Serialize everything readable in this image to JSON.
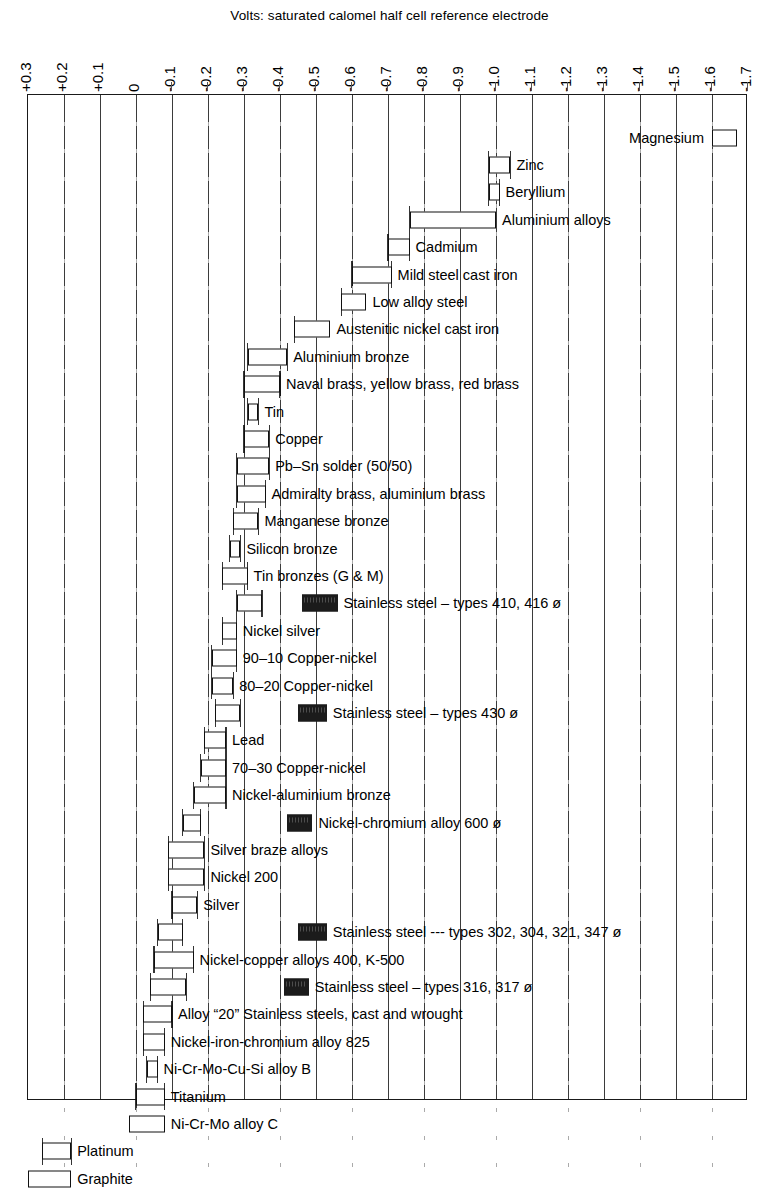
{
  "caption": "Volts: saturated calomel half cell reference electrode",
  "axis": {
    "tick_labels": [
      "+0.3",
      "+0.2",
      "+0.1",
      "0",
      "-0.1",
      "-0.2",
      "-0.3",
      "-0.4",
      "-0.5",
      "-0.6",
      "-0.7",
      "-0.8",
      "-0.9",
      "-1.0",
      "-1.1",
      "-1.2",
      "-1.3",
      "-1.4",
      "-1.5",
      "-1.6",
      "-1.7"
    ],
    "min": 0.3,
    "max": -1.7,
    "step": -0.1,
    "grid": true
  },
  "colors": {
    "active_bar_fill": "#ffffff",
    "passive_bar_fill": "#1b1b1b",
    "line": "#111111",
    "grid": "#3b3b3b"
  },
  "legend_note": "ø = passive (black bar) behaviour for stainless steels and nickel–chromium alloy",
  "chart_data": {
    "type": "bar",
    "orientation": "horizontal",
    "title": "Volts: saturated calomel half cell reference electrode",
    "xlabel": "Volts: saturated calomel half cell reference electrode",
    "ylabel": "",
    "xlim": [
      0.3,
      -1.7
    ],
    "xticks": [
      0.3,
      0.2,
      0.1,
      0,
      -0.1,
      -0.2,
      -0.3,
      -0.4,
      -0.5,
      -0.6,
      -0.7,
      -0.8,
      -0.9,
      -1.0,
      -1.1,
      -1.2,
      -1.3,
      -1.4,
      -1.5,
      -1.6,
      -1.7
    ],
    "grid": true,
    "legend": [
      "Active range (hollow bar)",
      "Passive range (solid bar)"
    ],
    "legend_position": "none",
    "rows": [
      {
        "label": "Magnesium",
        "label_side": "left",
        "bars": [
          {
            "start": -1.6,
            "end": -1.67,
            "state": "active"
          }
        ]
      },
      {
        "label": "Zinc",
        "label_side": "right",
        "bars": [
          {
            "start": -0.98,
            "end": -1.04,
            "state": "active"
          }
        ]
      },
      {
        "label": "Beryllium",
        "label_side": "right",
        "bars": [
          {
            "start": -0.98,
            "end": -1.01,
            "state": "active"
          }
        ]
      },
      {
        "label": "Aluminium alloys",
        "label_side": "right",
        "bars": [
          {
            "start": -0.76,
            "end": -1.0,
            "state": "active"
          }
        ]
      },
      {
        "label": "Cadmium",
        "label_side": "right",
        "bars": [
          {
            "start": -0.7,
            "end": -0.76,
            "state": "active"
          }
        ]
      },
      {
        "label": "Mild steel cast iron",
        "label_side": "right",
        "bars": [
          {
            "start": -0.6,
            "end": -0.71,
            "state": "active"
          }
        ]
      },
      {
        "label": "Low alloy steel",
        "label_side": "right",
        "bars": [
          {
            "start": -0.57,
            "end": -0.64,
            "state": "active"
          }
        ]
      },
      {
        "label": "Austenitic nickel cast iron",
        "label_side": "right",
        "bars": [
          {
            "start": -0.44,
            "end": -0.54,
            "state": "active"
          }
        ]
      },
      {
        "label": "Aluminium bronze",
        "label_side": "right",
        "bars": [
          {
            "start": -0.31,
            "end": -0.42,
            "state": "active"
          }
        ]
      },
      {
        "label": "Naval brass, yellow brass, red brass",
        "label_side": "right",
        "bars": [
          {
            "start": -0.3,
            "end": -0.4,
            "state": "active"
          }
        ]
      },
      {
        "label": "Tin",
        "label_side": "right",
        "bars": [
          {
            "start": -0.31,
            "end": -0.34,
            "state": "active"
          }
        ]
      },
      {
        "label": "Copper",
        "label_side": "right",
        "bars": [
          {
            "start": -0.3,
            "end": -0.37,
            "state": "active"
          }
        ]
      },
      {
        "label": "Pb–Sn solder (50/50)",
        "label_side": "right",
        "bars": [
          {
            "start": -0.28,
            "end": -0.37,
            "state": "active"
          }
        ]
      },
      {
        "label": "Admiralty brass, aluminium brass",
        "label_side": "right",
        "bars": [
          {
            "start": -0.28,
            "end": -0.36,
            "state": "active"
          }
        ]
      },
      {
        "label": "Manganese bronze",
        "label_side": "right",
        "bars": [
          {
            "start": -0.27,
            "end": -0.34,
            "state": "active"
          }
        ]
      },
      {
        "label": "Silicon bronze",
        "label_side": "right",
        "bars": [
          {
            "start": -0.26,
            "end": -0.29,
            "state": "active"
          }
        ]
      },
      {
        "label": "Tin bronzes (G & M)",
        "label_side": "right",
        "bars": [
          {
            "start": -0.24,
            "end": -0.31,
            "state": "active"
          }
        ]
      },
      {
        "label": "Stainless steel – types 410, 416 ø",
        "label_side": "right",
        "bars": [
          {
            "start": -0.28,
            "end": -0.35,
            "state": "active"
          },
          {
            "start": -0.46,
            "end": -0.56,
            "state": "passive"
          }
        ]
      },
      {
        "label": "Nickel silver",
        "label_side": "right",
        "bars": [
          {
            "start": -0.24,
            "end": -0.28,
            "state": "active"
          }
        ]
      },
      {
        "label": "90–10 Copper-nickel",
        "label_side": "right",
        "bars": [
          {
            "start": -0.21,
            "end": -0.28,
            "state": "active"
          }
        ]
      },
      {
        "label": "80–20 Copper-nickel",
        "label_side": "right",
        "bars": [
          {
            "start": -0.21,
            "end": -0.27,
            "state": "active"
          }
        ]
      },
      {
        "label": "Stainless steel – types 430 ø",
        "label_side": "right",
        "bars": [
          {
            "start": -0.22,
            "end": -0.29,
            "state": "active"
          },
          {
            "start": -0.45,
            "end": -0.53,
            "state": "passive"
          }
        ]
      },
      {
        "label": "Lead",
        "label_side": "right",
        "bars": [
          {
            "start": -0.19,
            "end": -0.25,
            "state": "active"
          }
        ]
      },
      {
        "label": "70–30 Copper-nickel",
        "label_side": "right",
        "bars": [
          {
            "start": -0.18,
            "end": -0.25,
            "state": "active"
          }
        ]
      },
      {
        "label": "Nickel-aluminium bronze",
        "label_side": "right",
        "bars": [
          {
            "start": -0.16,
            "end": -0.25,
            "state": "active"
          }
        ]
      },
      {
        "label": "Nickel-chromium alloy 600 ø",
        "label_side": "right",
        "bars": [
          {
            "start": -0.13,
            "end": -0.18,
            "state": "active"
          },
          {
            "start": -0.42,
            "end": -0.49,
            "state": "passive"
          }
        ]
      },
      {
        "label": "Silver braze alloys",
        "label_side": "right",
        "bars": [
          {
            "start": -0.09,
            "end": -0.19,
            "state": "active"
          }
        ]
      },
      {
        "label": "Nickel 200",
        "label_side": "right",
        "bars": [
          {
            "start": -0.09,
            "end": -0.19,
            "state": "active"
          }
        ]
      },
      {
        "label": "Silver",
        "label_side": "right",
        "bars": [
          {
            "start": -0.1,
            "end": -0.17,
            "state": "active"
          }
        ]
      },
      {
        "label": "Stainless steel --- types 302, 304, 321, 347 ø",
        "label_side": "right",
        "bars": [
          {
            "start": -0.06,
            "end": -0.13,
            "state": "active"
          },
          {
            "start": -0.45,
            "end": -0.53,
            "state": "passive"
          }
        ]
      },
      {
        "label": "Nickel-copper alloys 400, K-500",
        "label_side": "right",
        "bars": [
          {
            "start": -0.05,
            "end": -0.16,
            "state": "active"
          }
        ]
      },
      {
        "label": "Stainless steel – types 316, 317 ø",
        "label_side": "right",
        "bars": [
          {
            "start": -0.04,
            "end": -0.14,
            "state": "active"
          },
          {
            "start": -0.41,
            "end": -0.48,
            "state": "passive"
          }
        ]
      },
      {
        "label": "Alloy “20” Stainless steels, cast and wrought",
        "label_side": "right",
        "bars": [
          {
            "start": -0.02,
            "end": -0.1,
            "state": "active"
          }
        ]
      },
      {
        "label": "Nickel-iron-chromium alloy 825",
        "label_side": "right",
        "bars": [
          {
            "start": -0.02,
            "end": -0.08,
            "state": "active"
          }
        ]
      },
      {
        "label": "Ni-Cr-Mo-Cu-Si alloy B",
        "label_side": "right",
        "bars": [
          {
            "start": -0.03,
            "end": -0.06,
            "state": "active"
          }
        ]
      },
      {
        "label": "Titanium",
        "label_side": "right",
        "bars": [
          {
            "start": 0.0,
            "end": -0.08,
            "state": "active"
          }
        ]
      },
      {
        "label": "Ni-Cr-Mo alloy C",
        "label_side": "right",
        "bars": [
          {
            "start": 0.02,
            "end": -0.08,
            "state": "active"
          }
        ]
      },
      {
        "label": "Platinum",
        "label_side": "right",
        "bars": [
          {
            "start": 0.26,
            "end": 0.18,
            "state": "active"
          }
        ]
      },
      {
        "label": "Graphite",
        "label_side": "right",
        "bars": [
          {
            "start": 0.3,
            "end": 0.18,
            "state": "active"
          }
        ]
      }
    ]
  }
}
